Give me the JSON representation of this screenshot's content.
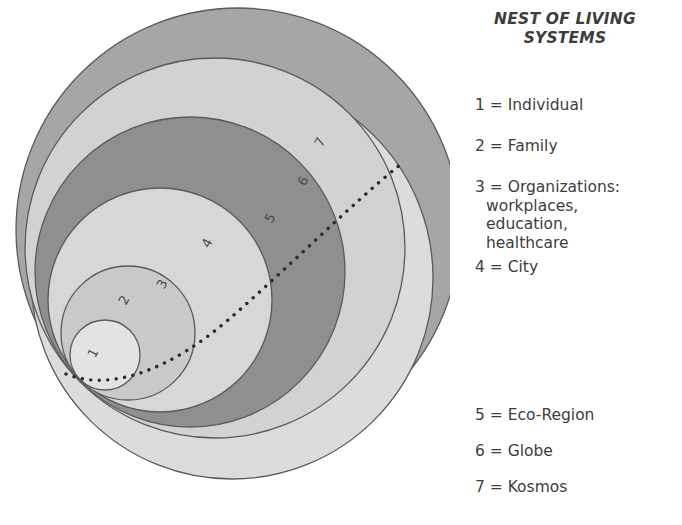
{
  "diagram": {
    "name": "nest-of-living-systems",
    "title": "NEST OF LIVING\nSYSTEMS",
    "style": {
      "outline_color": "#5a5a5a",
      "dotted_line_color": "#2b2b2b",
      "label_color": "#4a4a4a",
      "background": "#ffffff"
    },
    "circles": [
      {
        "id": "1",
        "label": "1",
        "fill": "#e3e3e3",
        "cx": 105,
        "cy": 355,
        "r": 35,
        "label_x": 97,
        "label_y": 355,
        "label_rotate": -62
      },
      {
        "id": "2",
        "label": "2",
        "fill": "#c9c9c9",
        "cx": 128,
        "cy": 333,
        "r": 67,
        "label_x": 128,
        "label_y": 302,
        "label_rotate": -62
      },
      {
        "id": "3",
        "label": "3",
        "fill": "#d7d7d7",
        "cx": 160,
        "cy": 300,
        "r": 112,
        "label_x": 166,
        "label_y": 286,
        "label_rotate": -62
      },
      {
        "id": "4",
        "label": "4",
        "fill": "#8f8f8f",
        "cx": 190,
        "cy": 272,
        "r": 155,
        "label_x": 211,
        "label_y": 245,
        "label_rotate": -62
      },
      {
        "id": "5",
        "label": "5",
        "fill": "#d2d2d2",
        "cx": 215,
        "cy": 248,
        "r": 190,
        "label_x": 274,
        "label_y": 220,
        "label_rotate": -62
      },
      {
        "id": "6",
        "label": "6",
        "fill": "#a6a6a6",
        "cx": 238,
        "cy": 230,
        "r": 222,
        "label_x": 307,
        "label_y": 183,
        "label_rotate": -62
      },
      {
        "id": "7",
        "label": "7",
        "fill": "#dcdcdc",
        "cx": 232,
        "cy": 278,
        "r": 201,
        "label_x": 324,
        "label_y": 144,
        "label_rotate": -62
      }
    ],
    "dotted_path": "M 66 374 C 110 392 170 370 228 320 C 286 270 350 205 401 164"
  },
  "legend": {
    "entries": [
      {
        "text": "1 = Individual",
        "continuation": "",
        "top": 96
      },
      {
        "text": "2 = Family",
        "continuation": "",
        "top": 137
      },
      {
        "text": "3 = Organizations:",
        "continuation": "workplaces,\neducation,\nhealthcare",
        "top": 178
      },
      {
        "text": "4 = City",
        "continuation": "",
        "top": 258
      },
      {
        "text": "5 = Eco-Region",
        "continuation": "",
        "top": 406
      },
      {
        "text": "6 = Globe",
        "continuation": "",
        "top": 442
      },
      {
        "text": "7 = Kosmos",
        "continuation": "",
        "top": 478
      }
    ]
  }
}
